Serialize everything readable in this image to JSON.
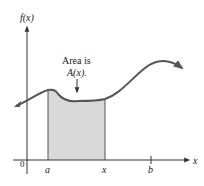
{
  "diagram": {
    "y_axis_label": "f(x)",
    "x_axis_label": "x",
    "origin_label": "0",
    "tick_labels": [
      "a",
      "x",
      "b"
    ],
    "annotation_line1": "Area is",
    "annotation_line2": "A(x).",
    "colors": {
      "curve": "#555555",
      "shaded_region": "#d9d9d9",
      "axes": "#333333",
      "text": "#222222"
    }
  }
}
